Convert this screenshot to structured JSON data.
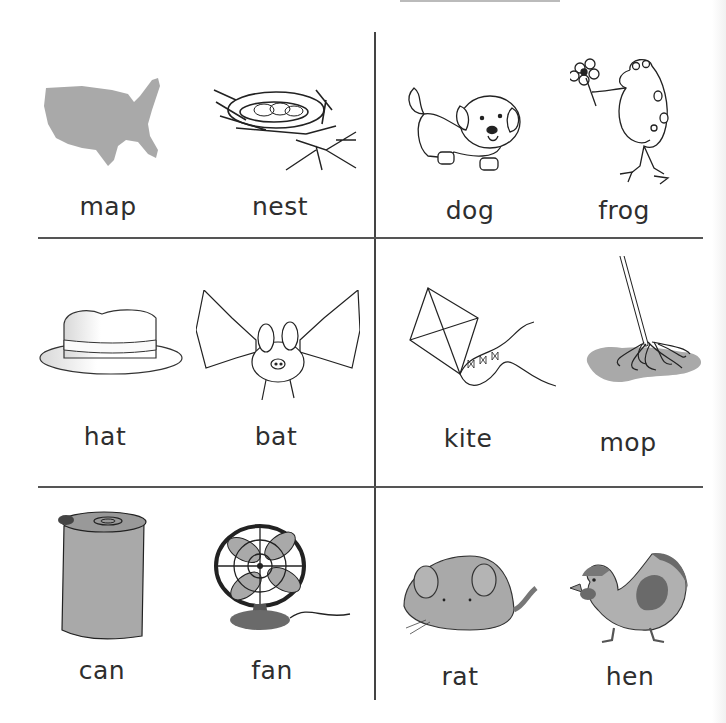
{
  "worksheet": {
    "cells": [
      {
        "position": "row1-left",
        "items": [
          {
            "word": "map",
            "icon": "us-map-icon"
          },
          {
            "word": "nest",
            "icon": "nest-icon"
          }
        ]
      },
      {
        "position": "row1-right",
        "items": [
          {
            "word": "dog",
            "icon": "dog-icon"
          },
          {
            "word": "frog",
            "icon": "frog-icon"
          }
        ]
      },
      {
        "position": "row2-left",
        "items": [
          {
            "word": "hat",
            "icon": "hat-icon"
          },
          {
            "word": "bat",
            "icon": "bat-icon"
          }
        ]
      },
      {
        "position": "row2-right",
        "items": [
          {
            "word": "kite",
            "icon": "kite-icon"
          },
          {
            "word": "mop",
            "icon": "mop-icon"
          }
        ]
      },
      {
        "position": "row3-left",
        "items": [
          {
            "word": "can",
            "icon": "can-icon"
          },
          {
            "word": "fan",
            "icon": "fan-icon"
          }
        ]
      },
      {
        "position": "row3-right",
        "items": [
          {
            "word": "rat",
            "icon": "rat-icon"
          },
          {
            "word": "hen",
            "icon": "hen-icon"
          }
        ]
      }
    ]
  },
  "colors": {
    "line": "#444444",
    "text": "#2e2e2e",
    "fill_gray": "#a8a8a8",
    "fill_dark": "#6e6e6e"
  }
}
